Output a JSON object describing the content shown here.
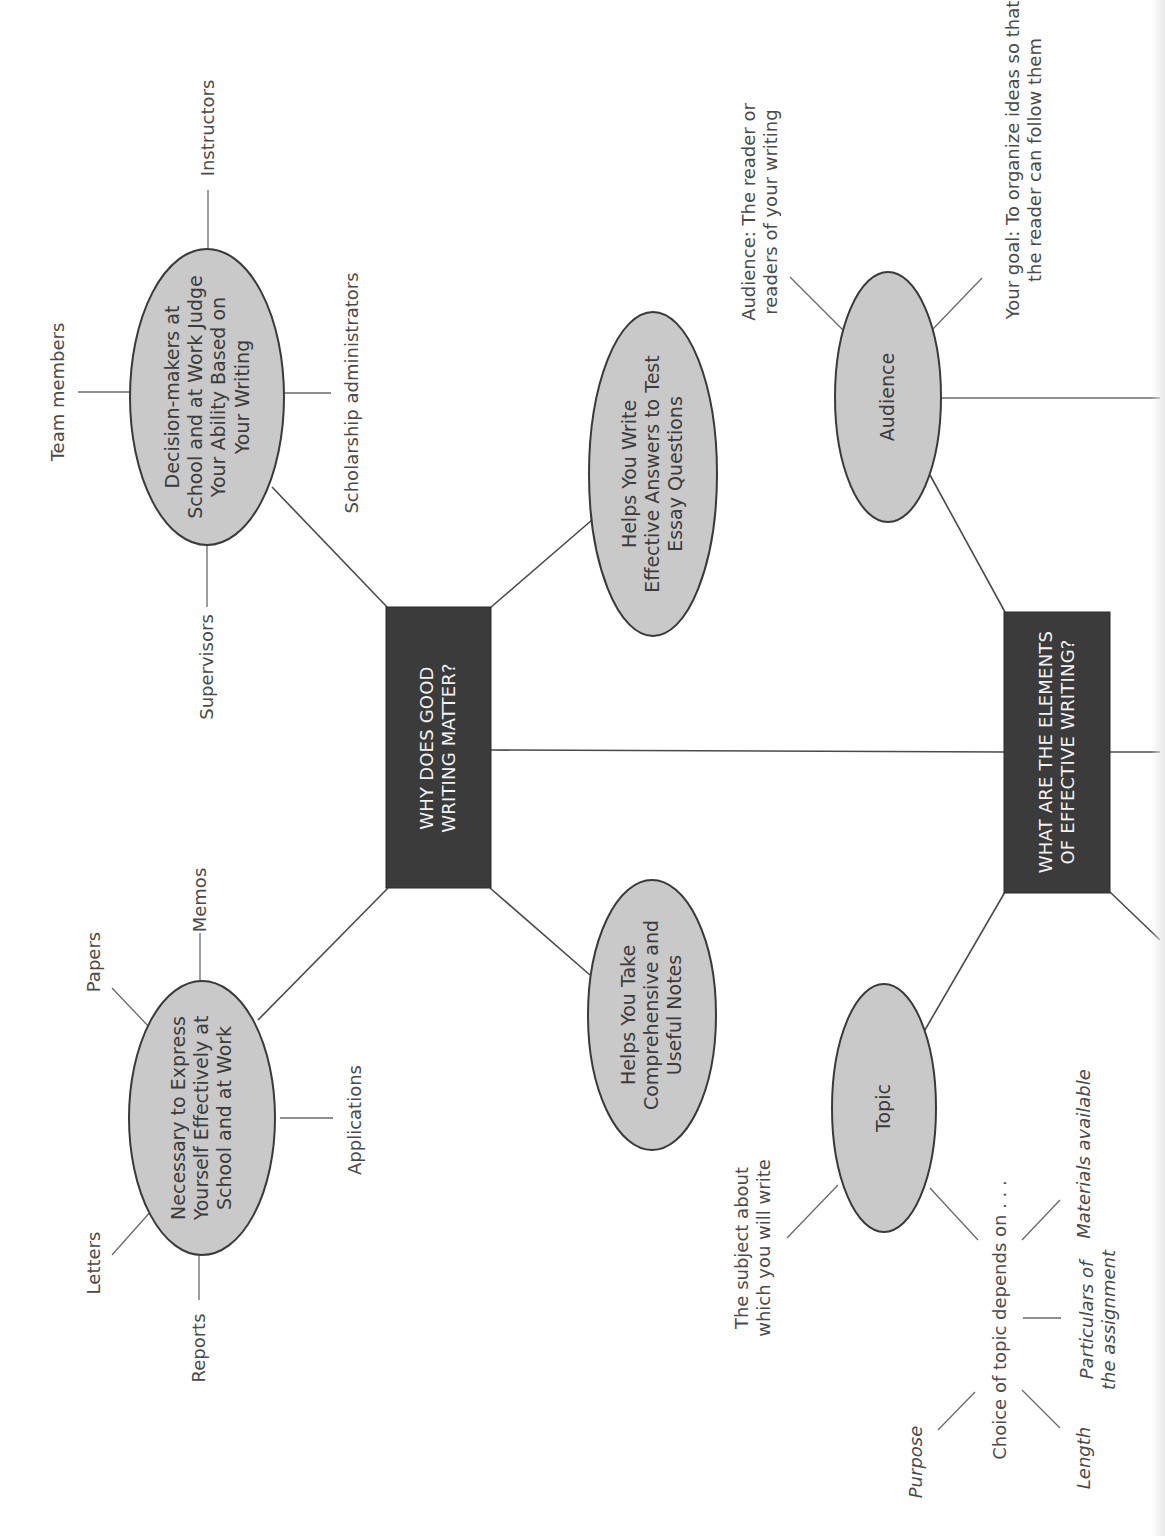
{
  "diagram": {
    "orientation": "rotated-90-ccw",
    "colors": {
      "oval_fill": "#c9c9c9",
      "oval_stroke": "#3a3a3a",
      "box_fill": "#3b3b3b",
      "box_text": "#f2f2f2",
      "line": "#4a4a4a",
      "text": "#444444"
    },
    "central_nodes": [
      {
        "id": "why",
        "label": "WHY DOES GOOD WRITING MATTER?",
        "lines": [
          "WHY DOES GOOD",
          "WRITING MATTER?"
        ]
      },
      {
        "id": "elements",
        "label": "WHAT ARE THE ELEMENTS OF EFFECTIVE WRITING?",
        "lines": [
          "WHAT ARE THE ELEMENTS",
          "OF EFFECTIVE WRITING?"
        ]
      }
    ],
    "why_branches": {
      "decision": {
        "lines": [
          "Decision-makers at",
          "School and at Work Judge",
          "Your Ability Based on",
          "Your Writing"
        ],
        "leaves": [
          "Instructors",
          "Team members",
          "Scholarship administrators",
          "Supervisors"
        ]
      },
      "necessary": {
        "lines": [
          "Necessary to Express",
          "Yourself Effectively at",
          "School and at Work"
        ],
        "leaves": [
          "Memos",
          "Papers",
          "Letters",
          "Reports",
          "Applications"
        ]
      },
      "essay": {
        "lines": [
          "Helps You Write",
          "Effective Answers to Test",
          "Essay Questions"
        ]
      },
      "notes": {
        "lines": [
          "Helps You Take",
          "Comprehensive and",
          "Useful Notes"
        ]
      }
    },
    "elements_branches": {
      "audience": {
        "label": "Audience",
        "notes": [
          {
            "lines": [
              "Audience: The reader or",
              "readers of your writing"
            ]
          },
          {
            "lines": [
              "Your goal: To organize ideas so that",
              "the reader can follow them"
            ]
          }
        ]
      },
      "topic": {
        "label": "Topic",
        "notes": [
          {
            "lines": [
              "The subject about",
              "which you will write"
            ]
          }
        ],
        "choice": {
          "label": "Choice of topic depends on . . .",
          "factors": [
            {
              "lines": [
                "Purpose"
              ]
            },
            {
              "lines": [
                "Length"
              ]
            },
            {
              "lines": [
                "Particulars of",
                "the assignment"
              ]
            },
            {
              "lines": [
                "Materials available"
              ]
            }
          ]
        }
      }
    }
  }
}
